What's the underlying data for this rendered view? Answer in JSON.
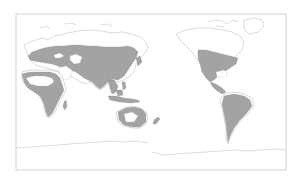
{
  "map": {
    "projection": "Pacific-centered world map",
    "frame": {
      "x": 16,
      "y": 14,
      "width": 270,
      "height": 156
    },
    "colors": {
      "background": "#ffffff",
      "land_outline": "#b4b4b4",
      "range_fill": "#a3a3a3",
      "frame": "#c8c8c8"
    },
    "legend": {
      "range_label": "Shaded: distribution range"
    },
    "regions": [
      {
        "id": "eurasia",
        "label": "Eurasia (range: temperate Europe and Asia)",
        "shaded": true
      },
      {
        "id": "africa",
        "label": "Africa (range: north and sub-Saharan)",
        "shaded": true
      },
      {
        "id": "south-asia",
        "label": "South and Southeast Asia",
        "shaded": true
      },
      {
        "id": "maritime-se-asia",
        "label": "Indonesia and Philippines",
        "shaded": true
      },
      {
        "id": "australia",
        "label": "Australia (range: eastern and northern)",
        "shaded": true
      },
      {
        "id": "new-zealand",
        "label": "New Zealand",
        "shaded": true
      },
      {
        "id": "north-america",
        "label": "North America (range: USA, Mexico)",
        "shaded": true
      },
      {
        "id": "central-america",
        "label": "Central America and Caribbean",
        "shaded": true
      },
      {
        "id": "south-america",
        "label": "South America",
        "shaded": true
      },
      {
        "id": "arctic",
        "label": "Arctic islands and Greenland",
        "shaded": false
      },
      {
        "id": "antarctica",
        "label": "Antarctica",
        "shaded": false
      }
    ]
  }
}
